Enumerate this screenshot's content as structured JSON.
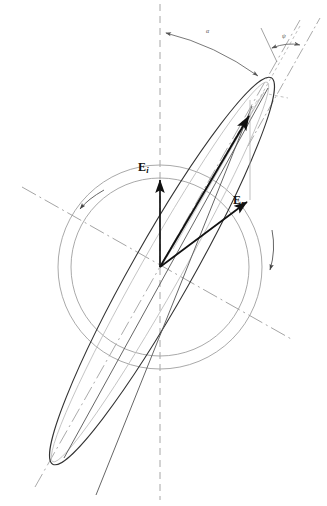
{
  "figure": {
    "type": "vector-diagram",
    "width": 327,
    "height": 506,
    "background": "#ffffff",
    "ink_color": "#111111",
    "construction_color": "#8c8c8c",
    "faint_color": "#b9b9b9"
  },
  "labels": {
    "e_incident": {
      "base": "E",
      "subscript": "i"
    },
    "e_reflected": {
      "base": "E",
      "subscript": "r"
    },
    "angle_alpha": "α",
    "angle_psi": "ψ"
  },
  "geometry": {
    "center": {
      "x": 160,
      "y": 267
    },
    "outer_circle_radius": 102,
    "inner_circle_radius": 89,
    "ellipse": {
      "semi_major": 222,
      "semi_minor": 30,
      "tilt_degrees": -60.5,
      "tip_upper": {
        "x": 263,
        "y": 93
      },
      "tip_lower": {
        "x": 61,
        "y": 450
      }
    },
    "vertical_reference_x": 160,
    "major_axis_angle_from_vertical_degrees": 29.5,
    "psi_offset_degrees": 7
  },
  "vectors": [
    {
      "name": "E_i",
      "from": {
        "x": 160,
        "y": 267
      },
      "to": {
        "x": 160,
        "y": 177
      }
    },
    {
      "name": "E_r",
      "from": {
        "x": 160,
        "y": 267
      },
      "to": {
        "x": 248,
        "y": 201
      }
    },
    {
      "name": "E_resultant",
      "from": {
        "x": 160,
        "y": 267
      },
      "to": {
        "x": 250,
        "y": 112
      }
    }
  ],
  "annotations": {
    "rotation_arrow_inner": "counterclockwise-arc-arrow",
    "rotation_arrow_outer": "clockwise-arc-arrow",
    "alpha_arc": "angle between vertical reference and ellipse major axis",
    "psi_arc": "angle between major axis and tangent construction line"
  }
}
